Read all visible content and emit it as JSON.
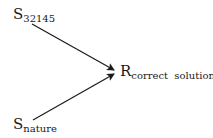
{
  "diagram": {
    "nodes": [
      {
        "id": "s32145",
        "main": "S",
        "sub": "32145"
      },
      {
        "id": "snature",
        "main": "S",
        "sub": "nature"
      },
      {
        "id": "rcorrect",
        "main": "R",
        "sub": "correct  solution"
      }
    ],
    "edges": [
      {
        "from": "s32145",
        "to": "rcorrect"
      },
      {
        "from": "snature",
        "to": "rcorrect"
      }
    ],
    "colors": {
      "line": "#1a1a1a",
      "background": "#ffffff"
    }
  }
}
